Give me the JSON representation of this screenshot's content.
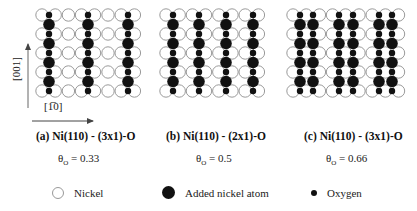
{
  "axes": {
    "vertical_label": "[001]",
    "horizontal_label": "[1̅0]"
  },
  "panels": [
    {
      "id": "a",
      "caption": "(a)  Ni(110) - (3x1)-O",
      "coverage_symbol": "θ",
      "coverage_subscript": "O",
      "coverage_value": "= 0.33",
      "added_row_period": 3,
      "chain_columns_x": [
        49,
        88,
        128
      ]
    },
    {
      "id": "b",
      "caption": "(b) Ni(110) - (2x1)-O",
      "coverage_symbol": "θ",
      "coverage_subscript": "O",
      "coverage_value": "= 0.5",
      "added_row_period": 2,
      "chain_columns_x": [
        173,
        199,
        226,
        253
      ]
    },
    {
      "id": "c",
      "caption": "(c) Ni(110) - (3x1)-O",
      "coverage_symbol": "θ",
      "coverage_subscript": "O",
      "coverage_value": "= 0.66",
      "added_row_period": 3,
      "chain_columns_x": [
        300,
        313,
        339,
        353,
        379,
        392
      ]
    }
  ],
  "legend": [
    {
      "symbol": "open-circle",
      "label": "Nickel"
    },
    {
      "symbol": "large-filled-circle",
      "label": "Added nickel atom"
    },
    {
      "symbol": "small-filled-circle",
      "label": "Oxygen"
    }
  ],
  "colors": {
    "nickel_outline": "#9a9a9a",
    "added_nickel": "#111111",
    "oxygen": "#111111",
    "axis": "#555555"
  }
}
